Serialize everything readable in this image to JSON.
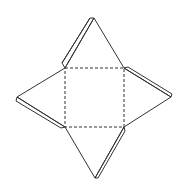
{
  "diagram": {
    "colors": {
      "line": "#333333",
      "background": "#ffffff"
    },
    "base_square": {
      "x1": 65,
      "y1": 68,
      "x2": 124,
      "y2": 127,
      "style": "dashed"
    },
    "faces": [
      {
        "name": "top",
        "apex": [
          94,
          18
        ]
      },
      {
        "name": "right",
        "apex": [
          171,
          97
        ]
      },
      {
        "name": "bottom",
        "apex": [
          95,
          178
        ]
      },
      {
        "name": "left",
        "apex": [
          17,
          97
        ]
      }
    ]
  }
}
